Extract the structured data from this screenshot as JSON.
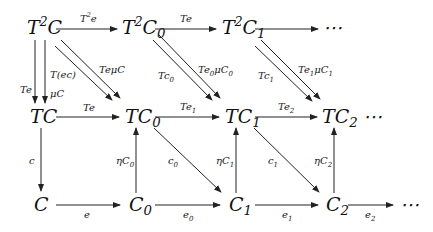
{
  "diagram": {
    "type": "commutative-diagram",
    "nodes": {
      "T2C": {
        "base": "T",
        "sup": "2",
        "rest": "C",
        "sub": ""
      },
      "T2C0": {
        "base": "T",
        "sup": "2",
        "rest": "C",
        "sub": "0"
      },
      "T2C1": {
        "base": "T",
        "sup": "2",
        "rest": "C",
        "sub": "1"
      },
      "top_dots": "⋯",
      "TC": {
        "base": "TC",
        "sub": ""
      },
      "TC0": {
        "base": "TC",
        "sub": "0"
      },
      "TC1": {
        "base": "TC",
        "sub": "1"
      },
      "TC2": {
        "base": "TC",
        "sub": "2"
      },
      "mid_dots": "⋯",
      "C": {
        "base": "C",
        "sub": ""
      },
      "C0": {
        "base": "C",
        "sub": "0"
      },
      "C1": {
        "base": "C",
        "sub": "1"
      },
      "C2": {
        "base": "C",
        "sub": "2"
      },
      "bot_dots": "⋯"
    },
    "edges": {
      "T2C_T2C0": {
        "main": "T",
        "sup": "2",
        "rest": "e"
      },
      "T2C0_T2C1": {
        "main": "Te"
      },
      "T2C_TC_left": {
        "main": "Te"
      },
      "T2C_TC_right_a": {
        "main": "T(ec)"
      },
      "T2C_TC_right_b": {
        "main": "μC"
      },
      "T2C_TC0_diag": {
        "main": "Te",
        "mid": "μ",
        "rest": "C"
      },
      "T2C0_TC1_a": {
        "main": "Tc",
        "sub": "0"
      },
      "T2C0_TC1_b": {
        "main": "Te",
        "sub": "0",
        "rest": "μC",
        "sub2": "0"
      },
      "T2C1_TC2_a": {
        "main": "Tc",
        "sub": "1"
      },
      "T2C1_TC2_b": {
        "main": "Te",
        "sub": "1",
        "rest": "μC",
        "sub2": "1"
      },
      "TC_TC0": {
        "main": "Te"
      },
      "TC0_TC1": {
        "main": "Te",
        "sub": "1"
      },
      "TC1_TC2": {
        "main": "Te",
        "sub": "2"
      },
      "TC_C": {
        "main": "c"
      },
      "C0_TC0": {
        "main": "ηC",
        "sub": "0"
      },
      "C1_TC1": {
        "main": "ηC",
        "sub": "1"
      },
      "C2_TC2": {
        "main": "ηC",
        "sub": "2"
      },
      "TC0_C1": {
        "main": "c",
        "sub": "0"
      },
      "TC1_C2": {
        "main": "c",
        "sub": "1"
      },
      "C_C0": {
        "main": "e"
      },
      "C0_C1": {
        "main": "e",
        "sub": "0"
      },
      "C1_C2": {
        "main": "e",
        "sub": "1"
      },
      "C2_dots": {
        "main": "e",
        "sub": "2"
      }
    }
  }
}
